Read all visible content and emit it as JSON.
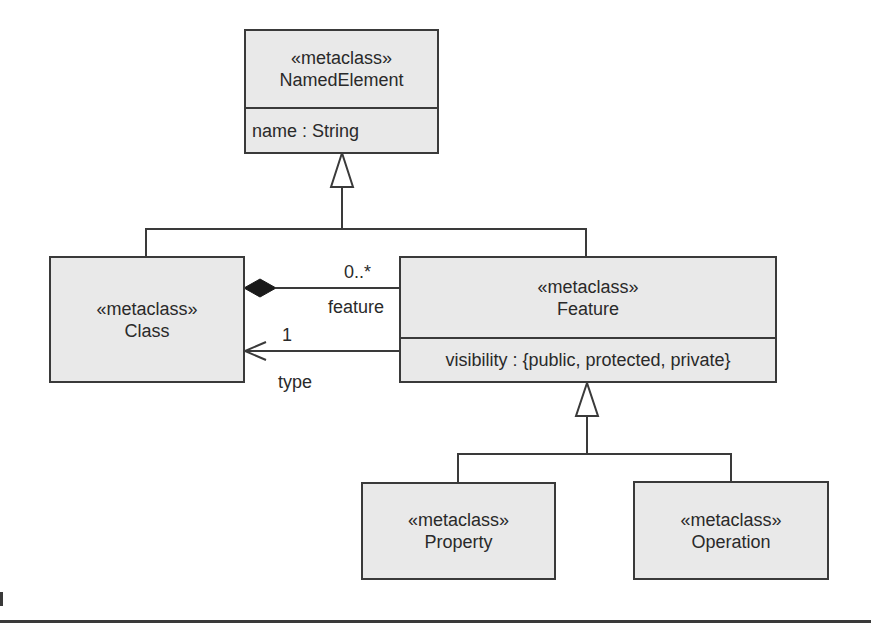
{
  "diagram": {
    "type": "UML class diagram",
    "classes": {
      "named_element": {
        "stereotype": "«metaclass»",
        "name": "NamedElement",
        "attribute": "name : String"
      },
      "class": {
        "stereotype": "«metaclass»",
        "name": "Class"
      },
      "feature": {
        "stereotype": "«metaclass»",
        "name": "Feature",
        "attribute": "visibility : {public, protected, private}"
      },
      "property": {
        "stereotype": "«metaclass»",
        "name": "Property"
      },
      "operation": {
        "stereotype": "«metaclass»",
        "name": "Operation"
      }
    },
    "associations": {
      "composition": {
        "from": "Class",
        "to": "Feature",
        "multiplicity": "0..*",
        "role": "feature"
      },
      "type_ref": {
        "from": "Feature",
        "to": "Class",
        "multiplicity": "1",
        "role": "type"
      }
    },
    "generalizations": [
      {
        "child": "Class",
        "parent": "NamedElement"
      },
      {
        "child": "Feature",
        "parent": "NamedElement"
      },
      {
        "child": "Property",
        "parent": "Feature"
      },
      {
        "child": "Operation",
        "parent": "Feature"
      }
    ]
  }
}
